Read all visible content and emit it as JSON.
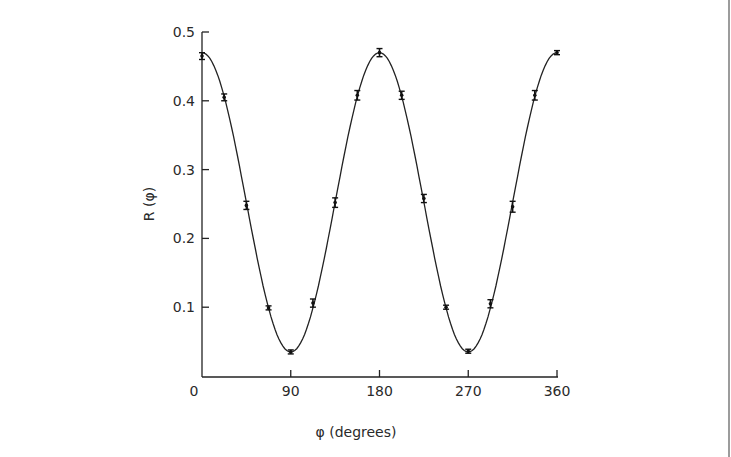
{
  "chart_data": {
    "type": "line",
    "title": "",
    "xlabel": "φ (degrees)",
    "ylabel": "R (φ)",
    "xlim": [
      0,
      360
    ],
    "ylim": [
      0,
      0.5
    ],
    "x_ticks": [
      0,
      90,
      180,
      270,
      360
    ],
    "x_tick_labels": [
      "0",
      "90",
      "180",
      "270",
      "360"
    ],
    "y_ticks": [
      0.1,
      0.2,
      0.3,
      0.4,
      0.5
    ],
    "y_tick_labels": [
      "0.1",
      "0.2",
      "0.3",
      "0.4",
      "0.5"
    ],
    "grid": false,
    "legend": null,
    "series": [
      {
        "name": "measured (with error bars)",
        "style": "points-with-errorbars",
        "x": [
          0,
          22.5,
          45,
          67.5,
          90,
          112.5,
          135,
          157.5,
          180,
          202.5,
          225,
          247.5,
          270,
          292.5,
          315,
          337.5,
          360
        ],
        "y": [
          0.465,
          0.405,
          0.248,
          0.099,
          0.035,
          0.106,
          0.252,
          0.408,
          0.47,
          0.408,
          0.258,
          0.1,
          0.036,
          0.105,
          0.246,
          0.408,
          0.47
        ],
        "yerr": [
          0.005,
          0.005,
          0.006,
          0.002,
          0.002,
          0.006,
          0.007,
          0.007,
          0.006,
          0.006,
          0.006,
          0.002,
          0.002,
          0.006,
          0.008,
          0.007,
          0.003
        ]
      },
      {
        "name": "fit",
        "style": "smooth-line",
        "function": "0.2525 + 0.2175*cos(2φ)",
        "max": 0.47,
        "min": 0.035
      }
    ]
  }
}
